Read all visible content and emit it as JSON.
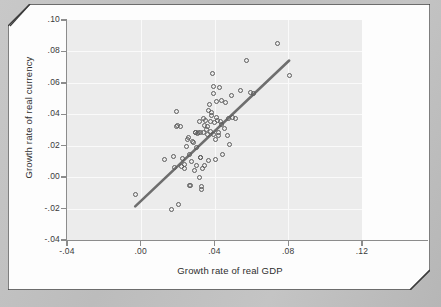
{
  "chart_data": {
    "type": "scatter",
    "title": "",
    "xlabel": "Growth rate of real GDP",
    "ylabel": "Growth rate of real currency",
    "xlim": [
      -0.04,
      0.12
    ],
    "ylim": [
      -0.04,
      0.1
    ],
    "xticks": [
      "-.04",
      ".00",
      ".04",
      ".08",
      ".12"
    ],
    "xtick_values": [
      -0.04,
      0.0,
      0.04,
      0.08,
      0.12
    ],
    "yticks": [
      ".10",
      ".08",
      ".06",
      ".04",
      ".02",
      ".00",
      "-.02",
      "-.04"
    ],
    "ytick_values": [
      0.1,
      0.08,
      0.06,
      0.04,
      0.02,
      0.0,
      -0.02,
      -0.04
    ],
    "grid": true,
    "legend": "none",
    "marker": "open-circle",
    "marker_color": "#5d5d5d",
    "panel_color": "#ececec",
    "gridline_color": "#fafafa",
    "fit_line": {
      "type": "linear",
      "color": "#6e6e6e",
      "x_start": -0.003,
      "y_start": -0.0186,
      "x_end": 0.0805,
      "y_end": 0.0742
    },
    "points": [
      [
        -0.003,
        -0.0112
      ],
      [
        0.0127,
        0.011
      ],
      [
        0.0168,
        -0.0206
      ],
      [
        0.018,
        0.0133
      ],
      [
        0.0183,
        0.0063
      ],
      [
        0.0192,
        0.0416
      ],
      [
        0.0196,
        0.0325
      ],
      [
        0.02,
        0.0327
      ],
      [
        0.0205,
        -0.0175
      ],
      [
        0.0216,
        0.032
      ],
      [
        0.0223,
        0.0068
      ],
      [
        0.0228,
        0.012
      ],
      [
        0.0235,
        0.0058
      ],
      [
        0.0237,
        0.008
      ],
      [
        0.0248,
        0.0198
      ],
      [
        0.0252,
        0.024
      ],
      [
        0.0257,
        0.0252
      ],
      [
        0.0263,
        0.0143
      ],
      [
        0.0265,
        -0.0053
      ],
      [
        0.0268,
        -0.0052
      ],
      [
        0.0276,
        0.01
      ],
      [
        0.0281,
        0.0224
      ],
      [
        0.0285,
        0.0218
      ],
      [
        0.029,
        0.004
      ],
      [
        0.0296,
        0.0286
      ],
      [
        0.0298,
        0.0281
      ],
      [
        0.03,
        0.0072
      ],
      [
        0.0304,
        0.019
      ],
      [
        0.0308,
        0.0279
      ],
      [
        0.0312,
        0.0286
      ],
      [
        0.0316,
        -0.0001
      ],
      [
        0.0319,
        0.0355
      ],
      [
        0.0322,
        0.0128
      ],
      [
        0.0325,
        0.0126
      ],
      [
        0.0326,
        0.0285
      ],
      [
        0.033,
        -0.0062
      ],
      [
        0.0331,
        -0.0077
      ],
      [
        0.0334,
        0.0058
      ],
      [
        0.0338,
        0.0283
      ],
      [
        0.0341,
        0.0374
      ],
      [
        0.0344,
        0.033
      ],
      [
        0.0348,
        0.0076
      ],
      [
        0.0352,
        0.0362
      ],
      [
        0.0356,
        0.0303
      ],
      [
        0.036,
        0.027
      ],
      [
        0.0362,
        0.032
      ],
      [
        0.0366,
        0.0105
      ],
      [
        0.037,
        0.0424
      ],
      [
        0.0373,
        0.0465
      ],
      [
        0.0376,
        0.0352
      ],
      [
        0.0379,
        0.0289
      ],
      [
        0.0382,
        0.041
      ],
      [
        0.0386,
        0.039
      ],
      [
        0.039,
        0.0658
      ],
      [
        0.0392,
        0.058
      ],
      [
        0.0394,
        0.0535
      ],
      [
        0.0396,
        0.0272
      ],
      [
        0.04,
        0.0345
      ],
      [
        0.0403,
        0.0114
      ],
      [
        0.0406,
        0.0238
      ],
      [
        0.041,
        0.0482
      ],
      [
        0.0413,
        0.038
      ],
      [
        0.0416,
        0.0363
      ],
      [
        0.042,
        0.0285
      ],
      [
        0.0424,
        0.0262
      ],
      [
        0.0428,
        0.057
      ],
      [
        0.0432,
        0.0355
      ],
      [
        0.0436,
        0.0487
      ],
      [
        0.044,
        0.0338
      ],
      [
        0.0444,
        0.0142
      ],
      [
        0.0452,
        0.0308
      ],
      [
        0.046,
        0.0474
      ],
      [
        0.0468,
        0.0262
      ],
      [
        0.0476,
        0.0372
      ],
      [
        0.0484,
        0.0208
      ],
      [
        0.0492,
        0.0519
      ],
      [
        0.05,
        0.0378
      ],
      [
        0.0512,
        0.0372
      ],
      [
        0.054,
        0.0552
      ],
      [
        0.0576,
        0.074
      ],
      [
        0.0596,
        0.0538
      ],
      [
        0.0612,
        0.0535
      ],
      [
        0.074,
        0.0848
      ],
      [
        0.0806,
        0.0645
      ]
    ]
  },
  "figure": {
    "x_axis_title": "Growth rate of real GDP",
    "y_axis_title": "Growth rate of real currency"
  }
}
